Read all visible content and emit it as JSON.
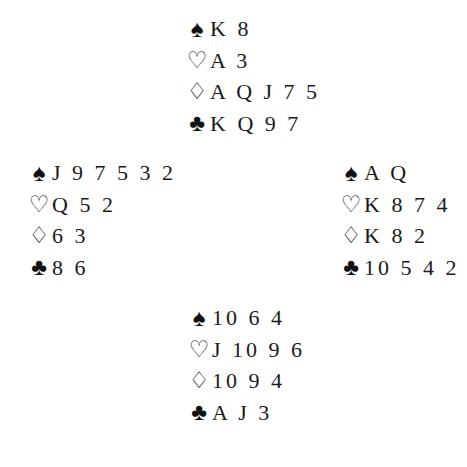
{
  "suit_symbols": {
    "spades": "♠",
    "hearts": "♡",
    "diamonds": "♢",
    "clubs": "♣"
  },
  "hands": {
    "north": {
      "spades": "K 8",
      "hearts": "A 3",
      "diamonds": "A Q J 7 5",
      "clubs": "K Q 9 7"
    },
    "west": {
      "spades": "J 9 7 5 3 2",
      "hearts": "Q 5 2",
      "diamonds": "6 3",
      "clubs": "8 6"
    },
    "east": {
      "spades": "A Q",
      "hearts": "K 8 7 4",
      "diamonds": "K 8 2",
      "clubs": "10 5 4 2"
    },
    "south": {
      "spades": "10 6 4",
      "hearts": "J 10 9 6",
      "diamonds": "10 9 4",
      "clubs": "A J 3"
    }
  }
}
